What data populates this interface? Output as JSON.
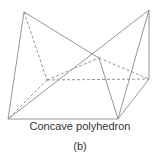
{
  "figure": {
    "title": "Concave polyhedron",
    "label": "(b)",
    "line_color": "#8a8a8a",
    "vertices": {
      "TL": [
        24,
        12
      ],
      "TR": [
        149,
        10
      ],
      "BL": [
        8,
        119
      ],
      "BR": [
        118,
        119
      ],
      "RM": [
        149,
        79
      ],
      "C": [
        99,
        58
      ],
      "IN": [
        47,
        80
      ]
    },
    "solid_edges": [
      [
        "TL",
        "BL"
      ],
      [
        "TL",
        "C"
      ],
      [
        "BL",
        "BR"
      ],
      [
        "BL",
        "TR"
      ],
      [
        "C",
        "BR"
      ],
      [
        "TR",
        "BR"
      ],
      [
        "TR",
        "RM"
      ],
      [
        "RM",
        "BR"
      ]
    ],
    "dashed_edges": [
      [
        "TL",
        "IN"
      ],
      [
        "IN",
        "BL"
      ],
      [
        "IN",
        "C"
      ],
      [
        "IN",
        "RM"
      ],
      [
        "C",
        "RM"
      ]
    ]
  }
}
